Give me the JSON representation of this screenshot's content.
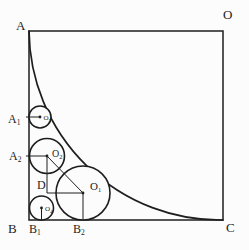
{
  "colors": {
    "background": "#fcfcfc",
    "ink": "#1e1e1e"
  },
  "figure": {
    "vertices": {
      "top_left": "A",
      "top_right": "O",
      "bottom_left": "B",
      "bottom_right": "C"
    },
    "tangent_points": {
      "a1": {
        "base": "A",
        "sub": "1"
      },
      "a2": {
        "base": "A",
        "sub": "2"
      },
      "b1": {
        "base": "B",
        "sub": "1"
      },
      "b2": {
        "base": "B",
        "sub": "2"
      },
      "d": "D"
    },
    "circle_centers": {
      "o1": {
        "base": "O",
        "sub": "1"
      },
      "o2": {
        "base": "O",
        "sub": "2"
      },
      "o3": {
        "base": "O",
        "sub": "3"
      },
      "o4": {
        "base": "O",
        "sub": "4"
      }
    }
  }
}
